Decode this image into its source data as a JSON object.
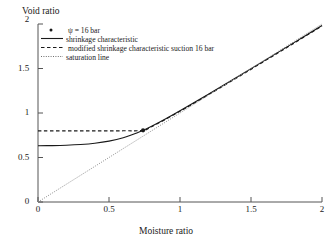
{
  "chart_data": {
    "type": "line",
    "title": "",
    "xlabel": "Moisture ratio",
    "ylabel": "Void ratio",
    "xlim": [
      0,
      2
    ],
    "ylim": [
      0,
      2
    ],
    "xticks": [
      "0",
      "0.5",
      "1",
      "1.5",
      "2"
    ],
    "xtick_values": [
      0,
      0.5,
      1,
      1.5,
      2
    ],
    "yticks": [
      "0",
      "0.5",
      "1",
      "1.5",
      "2"
    ],
    "ytick_values": [
      0,
      0.5,
      1,
      1.5,
      2
    ],
    "grid": false,
    "legend_position": "upper-left-inside",
    "legend": [
      {
        "label": "ψ = 16 bar",
        "style": "marker",
        "marker": "dot"
      },
      {
        "label": "shrinkage characteristic",
        "style": "solid"
      },
      {
        "label": "modified shrinkage characteristic suction 16 bar",
        "style": "dashed"
      },
      {
        "label": "saturation line",
        "style": "dotted"
      }
    ],
    "series": [
      {
        "name": "shrinkage characteristic",
        "style": "solid",
        "x": [
          0.0,
          0.1,
          0.2,
          0.3,
          0.4,
          0.5,
          0.6,
          0.7,
          0.74,
          0.8,
          0.9,
          1.0,
          1.2,
          1.4,
          1.6,
          1.8,
          2.0
        ],
        "y": [
          0.632,
          0.634,
          0.638,
          0.646,
          0.66,
          0.684,
          0.722,
          0.778,
          0.805,
          0.85,
          0.935,
          1.025,
          1.212,
          1.402,
          1.594,
          1.788,
          1.983
        ]
      },
      {
        "name": "modified shrinkage characteristic suction 16 bar",
        "style": "dashed",
        "x": [
          0.0,
          0.2,
          0.4,
          0.6,
          0.74,
          0.8,
          1.0,
          1.2,
          1.4,
          1.6,
          1.8,
          2.0
        ],
        "y": [
          0.8,
          0.8,
          0.8,
          0.8,
          0.805,
          0.845,
          1.02,
          1.205,
          1.395,
          1.588,
          1.782,
          1.978
        ]
      },
      {
        "name": "saturation line",
        "style": "dotted",
        "x": [
          0.0,
          2.0
        ],
        "y": [
          0.0,
          2.0
        ]
      }
    ],
    "points": [
      {
        "name": "ψ = 16 bar",
        "x": 0.74,
        "y": 0.805
      }
    ],
    "colors": {
      "axis": "#555555",
      "shrinkage": "#1a1a1a",
      "modified": "#1a1a1a",
      "saturation": "#8d8d8d",
      "marker": "#1a1a1a",
      "background": "#ffffff"
    }
  }
}
